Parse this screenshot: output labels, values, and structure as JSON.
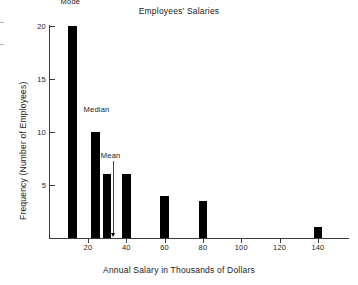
{
  "chart_data": {
    "type": "bar",
    "title": "Employees' Salaries",
    "xlabel": "Annual Salary in Thousands of Dollars",
    "ylabel": "Frequency (Number of Employees)",
    "grid": false,
    "legend": "none",
    "xlim": [
      0,
      155
    ],
    "ylim": [
      0,
      20
    ],
    "x": [
      12,
      24,
      30,
      40,
      60,
      80,
      140
    ],
    "values": [
      20,
      10,
      6,
      6,
      4,
      3.5,
      1
    ],
    "bar_width": 4.5,
    "xticks": [
      20,
      40,
      60,
      80,
      100,
      120,
      140
    ],
    "xtick_labels": [
      "20",
      "40",
      "60",
      "80",
      "100",
      "120",
      "140"
    ],
    "yticks": [
      5,
      10,
      15,
      20
    ],
    "ytick_labels": [
      "5",
      "10",
      "15",
      "20"
    ],
    "annotations": [
      {
        "label": "Mode",
        "x": 12,
        "y": 21.9,
        "pointer": false
      },
      {
        "label": "Median",
        "x": 24,
        "y": 11.8,
        "pointer": false
      },
      {
        "label": "Mean",
        "x": 33,
        "y": 7.4,
        "pointer": true
      }
    ]
  }
}
